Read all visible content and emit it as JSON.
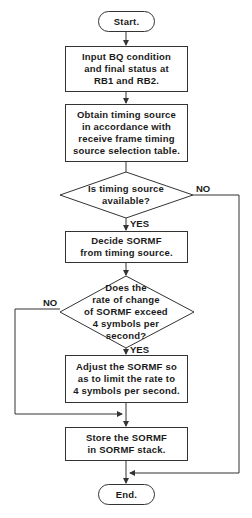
{
  "flowchart": {
    "start": {
      "label": "Start."
    },
    "steps": [
      {
        "id": "input",
        "label": "Input BQ condition\nand final status at\nRB1 and RB2."
      },
      {
        "id": "obtain",
        "label": "Obtain timing source\nin accordance with\nreceive frame timing\nsource selection table."
      },
      {
        "id": "decide",
        "label": "Decide SORMF\nfrom timing source."
      },
      {
        "id": "adjust",
        "label": "Adjust the SORMF so\nas to limit the rate to\n4 symbols per second."
      },
      {
        "id": "store",
        "label": "Store the SORMF\nin SORMF stack."
      }
    ],
    "decisions": [
      {
        "id": "available",
        "label": "Is timing source\navailable?",
        "yes_label": "YES",
        "no_label": "NO"
      },
      {
        "id": "rate",
        "label": "Does the\nrate of change\nof SORMF exceed\n4 symbols per\nsecond?",
        "yes_label": "YES",
        "no_label": "NO"
      }
    ],
    "end": {
      "label": "End."
    },
    "colors": {
      "line": "#333333",
      "background": "#ffffff"
    }
  }
}
